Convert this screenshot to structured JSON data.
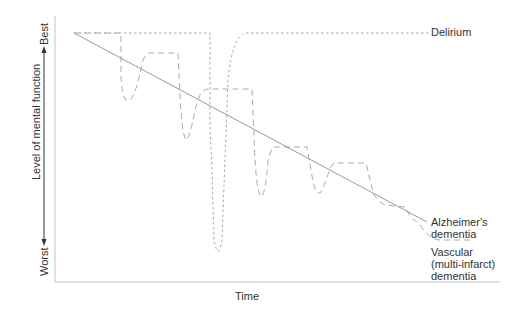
{
  "figure": {
    "x_axis_label": "Time",
    "y_axis_label": "Level of mental function",
    "y_axis_top": "Best",
    "y_axis_bottom": "Worst"
  },
  "legend": {
    "delirium": "Delirium",
    "alzheimers_line1": "Alzheimer's",
    "alzheimers_line2": "dementia",
    "vascular_line1": "Vascular",
    "vascular_line2": "(multi-infarct)",
    "vascular_line3": "dementia"
  },
  "colors": {
    "axis": "#bbbbbb",
    "alzheimers": "#999999",
    "vascular": "#aaaaaa",
    "delirium": "#aaaaaa",
    "text": "#333333"
  }
}
